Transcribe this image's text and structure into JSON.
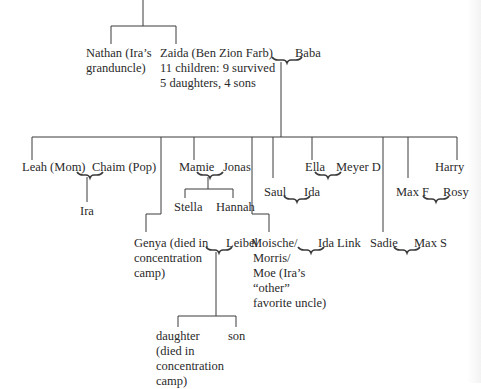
{
  "diagram": {
    "type": "family-tree",
    "top_generation": {
      "nathan": "Nathan (Ira’s grandunclе)",
      "nathan_line1": "Nathan (Ira’s",
      "nathan_line2": "granduncle)",
      "zaida_line1": "Zaida (Ben Zion Farb)",
      "zaida_line2": "11 children: 9 survived",
      "zaida_line3": "5 daughters, 4 sons",
      "baba": "Baba"
    },
    "children": {
      "leah": "Leah (Mom)",
      "chaim": "Chaim (Pop)",
      "ira": "Ira",
      "mamie": "Mamie",
      "jonas": "Jonas",
      "stella": "Stella",
      "hannah": "Hannah",
      "genya_line1": "Genya (died in",
      "genya_line2": "concentration",
      "genya_line3": "camp)",
      "leibel": "Leibel",
      "daughter_line1": "daughter",
      "daughter_line2": "(died in",
      "daughter_line3": "concentration",
      "daughter_line4": "camp)",
      "son": "son",
      "moische_line1": "Moische/",
      "moische_line2": "Morris/",
      "moische_line3": "Moe (Ira’s",
      "moische_line4": "“other”",
      "moische_line5": "favorite uncle)",
      "ida_link": "Ida Link",
      "saul": "Saul",
      "ida": "Ida",
      "ella": "Ella",
      "meyer_d": "Meyer D",
      "sadie": "Sadie",
      "max_s": "Max S",
      "max_f": "Max F",
      "rosy": "Rosy",
      "harry": "Harry"
    }
  }
}
